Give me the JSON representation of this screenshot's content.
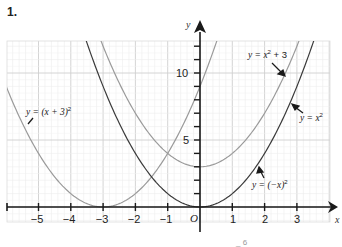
{
  "question": {
    "number": "1."
  },
  "chart_data": {
    "type": "line",
    "title": "",
    "xlabel": "x",
    "ylabel": "y",
    "xlim": [
      -5.9,
      4.0
    ],
    "ylim": [
      -1.1,
      12.5
    ],
    "grid": true,
    "origin_label": "O",
    "x_ticks": [
      -5,
      -4,
      -3,
      -2,
      -1,
      1,
      2,
      3
    ],
    "x_tick_labels": [
      "−5",
      "−4",
      "−3",
      "−2",
      "−1",
      "1",
      "2",
      "3"
    ],
    "y_tick_labels": [
      {
        "value": 5,
        "label": "5"
      },
      {
        "value": 10,
        "label": "10"
      }
    ],
    "series": [
      {
        "name": "y = (x + 3)²",
        "color": "#9a9a9a",
        "expression": "(x+3)^2",
        "points": [
          [
            -5.9,
            8.41
          ],
          [
            -5,
            4
          ],
          [
            -4,
            1
          ],
          [
            -3,
            0
          ],
          [
            -2,
            1
          ],
          [
            -1,
            4
          ],
          [
            0,
            9
          ],
          [
            0.5,
            12.25
          ]
        ]
      },
      {
        "name": "y = x² + 3",
        "color": "#9a9a9a",
        "expression": "x^2+3",
        "points": [
          [
            -3,
            12
          ],
          [
            -2,
            7
          ],
          [
            -1,
            4
          ],
          [
            0,
            3
          ],
          [
            1,
            4
          ],
          [
            2,
            7
          ],
          [
            3,
            12
          ]
        ]
      },
      {
        "name": "y = x²",
        "color": "#3a3a3a",
        "expression": "x^2",
        "points": [
          [
            -3.5,
            12.25
          ],
          [
            -3,
            9
          ],
          [
            -2,
            4
          ],
          [
            -1,
            1
          ],
          [
            0,
            0
          ],
          [
            1,
            1
          ],
          [
            2,
            4
          ],
          [
            3,
            9
          ],
          [
            3.5,
            12.25
          ]
        ]
      },
      {
        "name": "y = (−x)²",
        "color": "#3a3a3a",
        "expression": "(-x)^2",
        "same_as": "y = x²"
      }
    ],
    "annotations": [
      {
        "text": "y = (x + 3)²",
        "points_to": "left curve"
      },
      {
        "text": "y = x² + 3",
        "points_to": "upper right curve"
      },
      {
        "text": "y = x²",
        "points_to": "lower right curve"
      },
      {
        "text": "y = (−x)²",
        "points_to": "lower right curve"
      }
    ]
  },
  "labels": {
    "x_axis": "x",
    "y_axis": "y",
    "origin": "O",
    "tick_m5": "−5",
    "tick_m4": "−4",
    "tick_m3": "−3",
    "tick_m2": "−2",
    "tick_m1": "−1",
    "tick_1": "1",
    "tick_2": "2",
    "tick_3": "3",
    "ytick_5": "5",
    "ytick_10": "10",
    "ann_shift_y": "y = (x + 3)",
    "ann_shift_sup": "2",
    "ann_plus3": "y = x",
    "ann_plus3_sup": "2",
    "ann_plus3_tail": " + 3",
    "ann_x2": "y = x",
    "ann_x2_sup": "2",
    "ann_negx": "y = (−x)",
    "ann_negx_sup": "2"
  }
}
